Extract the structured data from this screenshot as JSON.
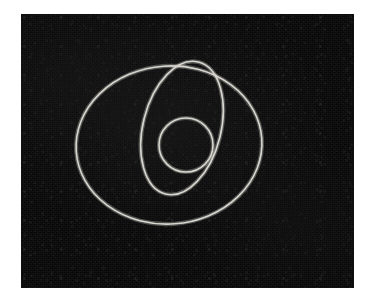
{
  "page": {
    "background_color": "#ffffff",
    "width": 369,
    "height": 305
  },
  "photo": {
    "name": "dark-field-photograph",
    "description": "Photographic dark panel with three thin light-colored circle outlines",
    "panel": {
      "x": 21,
      "y": 14,
      "width": 333,
      "height": 274,
      "fill_color": "#070707",
      "grain": "visible sensor noise / film grain"
    },
    "stroke_color": "#d8d6cf",
    "stroke_width": 1.6,
    "shapes": [
      {
        "name": "large-circle",
        "label": "Large circle",
        "cx": 169,
        "cy": 145,
        "rx": 93,
        "ry": 79,
        "rotation": -4
      },
      {
        "name": "medium-circle",
        "label": "Medium circle",
        "cx": 182,
        "cy": 128,
        "rx": 39,
        "ry": 68,
        "rotation": 14
      },
      {
        "name": "small-circle",
        "label": "Small circle",
        "cx": 186,
        "cy": 145,
        "rx": 27,
        "ry": 27,
        "rotation": 0
      }
    ]
  }
}
